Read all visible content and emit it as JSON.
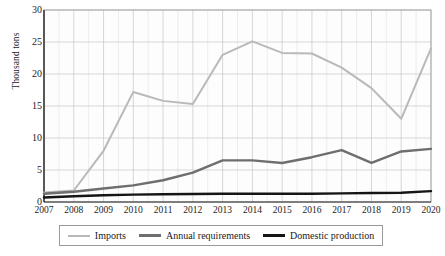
{
  "chart_data": {
    "type": "line",
    "title": "",
    "xlabel": "",
    "ylabel": "Thousand tons",
    "categories": [
      2007,
      2008,
      2009,
      2010,
      2011,
      2012,
      2013,
      2014,
      2015,
      2016,
      2017,
      2018,
      2019,
      2020
    ],
    "xtick_labels": [
      "2007",
      "2008",
      "2009",
      "2010",
      "2011",
      "2012",
      "2013",
      "2014",
      "2015",
      "2016",
      "2017",
      "2018",
      "2019",
      "2020"
    ],
    "ytick_labels": [
      "0",
      "5",
      "10",
      "15",
      "20",
      "25",
      "30"
    ],
    "ytick_values": [
      0,
      5,
      10,
      15,
      20,
      25,
      30
    ],
    "ylim": [
      0,
      30
    ],
    "xlim": [
      2007,
      2020
    ],
    "grid": true,
    "legend_position": "bottom",
    "series": [
      {
        "name": "Imports",
        "color": "#b9b9b9",
        "width": 2.0,
        "values": [
          1.5,
          1.8,
          8.0,
          17.2,
          15.8,
          15.3,
          23.0,
          25.1,
          23.3,
          23.2,
          21.0,
          17.8,
          13.0,
          24.0
        ]
      },
      {
        "name": "Annual requirements",
        "color": "#6e6e6e",
        "width": 2.4,
        "values": [
          1.3,
          1.6,
          2.1,
          2.6,
          3.4,
          4.6,
          6.5,
          6.5,
          6.1,
          7.0,
          8.1,
          6.1,
          7.9,
          8.3
        ]
      },
      {
        "name": "Domestic production",
        "color": "#151515",
        "width": 2.4,
        "values": [
          0.7,
          0.9,
          1.05,
          1.15,
          1.2,
          1.25,
          1.3,
          1.3,
          1.3,
          1.3,
          1.35,
          1.4,
          1.45,
          1.7
        ]
      }
    ],
    "series_overrides": {
      "Annual requirements": [
        1.3,
        1.6,
        2.1,
        2.6,
        3.4,
        4.6,
        6.5,
        6.5,
        6.1,
        7.0,
        8.1,
        6.1,
        7.9,
        8.3
      ]
    }
  },
  "legend": {
    "items": [
      {
        "label": "Imports",
        "swatch": "s-imports"
      },
      {
        "label": "Annual requirements",
        "swatch": "s-annual"
      },
      {
        "label": "Domestic production",
        "swatch": "s-dom"
      }
    ]
  },
  "caption": ""
}
